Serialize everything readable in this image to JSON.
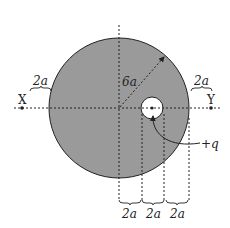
{
  "diagram": {
    "colors": {
      "disk_fill": "#9a9a9a",
      "hole_fill": "#ffffff",
      "stroke": "#222222",
      "background": "#ffffff"
    },
    "labels": {
      "point_x": "X",
      "point_y": "Y",
      "radius": "6a",
      "left_gap": "2a",
      "right_gap": "2a",
      "charge": "+q",
      "bottom_1": "2a",
      "bottom_2": "2a",
      "bottom_3": "2a"
    }
  }
}
